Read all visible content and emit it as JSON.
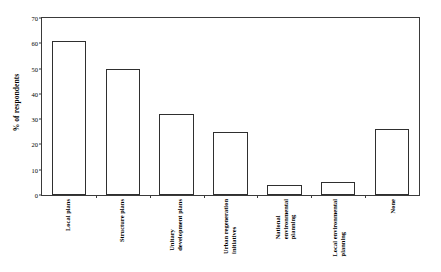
{
  "chart_data": {
    "type": "bar",
    "title": "",
    "xlabel": "",
    "ylabel": "% of respondents",
    "ylim": [
      0,
      70
    ],
    "ytick_values": [
      0,
      10,
      20,
      30,
      40,
      50,
      60,
      70
    ],
    "ytick_labels": [
      "0",
      "10",
      "20",
      "30",
      "40",
      "50",
      "60",
      "70"
    ],
    "grid": false,
    "legend": "none",
    "bar_style": {
      "fill": "#ffffff",
      "edge": "#2f2f2f"
    },
    "categories": [
      "Local plans",
      "Structure plans",
      "Unitary development plans",
      "Urban regeneration initiatives",
      "National environmental planning",
      "Local environmental planning",
      "None"
    ],
    "category_lines": [
      [
        "Local plans"
      ],
      [
        "Structure plans"
      ],
      [
        "Unitary",
        "development plans"
      ],
      [
        "Urban regeneration",
        "initiatives"
      ],
      [
        "National",
        "environmental",
        "planning"
      ],
      [
        "Local environmental",
        "planning"
      ],
      [
        "None"
      ]
    ],
    "values": [
      61,
      50,
      32,
      25,
      4,
      5,
      26
    ]
  }
}
